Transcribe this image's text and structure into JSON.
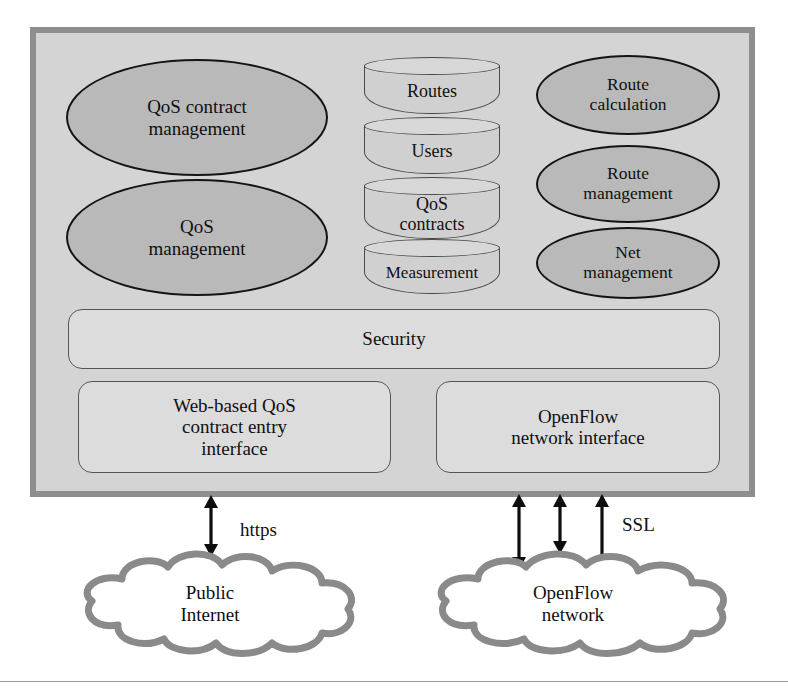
{
  "diagram": {
    "colors": {
      "frame_fill": "#d4d4d4",
      "frame_border": "#8e8e8e",
      "ellipse_fill": "#b9b9b9",
      "ellipse_border": "#141414",
      "cylinder_fill": "#d0d0d0",
      "cylinder_border": "#4a4a4a",
      "rrect_fill": "#dcdcdc",
      "rrect_border": "#555555",
      "cloud_fill": "#ffffff",
      "cloud_border": "#8a8a8a",
      "arrow_color": "#0d0d0d",
      "text_color": "#101010"
    }
  },
  "controller": {
    "modules_left": [
      {
        "id": "qos-contract-management",
        "label": "QoS contract\nmanagement"
      },
      {
        "id": "qos-management",
        "label": "QoS\nmanagement"
      }
    ],
    "datastores": [
      {
        "id": "routes",
        "label": "Routes"
      },
      {
        "id": "users",
        "label": "Users"
      },
      {
        "id": "qos-contracts",
        "label": "QoS\ncontracts"
      },
      {
        "id": "measurement",
        "label": "Measurement"
      }
    ],
    "modules_right": [
      {
        "id": "route-calculation",
        "label": "Route\ncalculation"
      },
      {
        "id": "route-management",
        "label": "Route\nmanagement"
      },
      {
        "id": "net-management",
        "label": "Net\nmanagement"
      }
    ],
    "security_layer": {
      "id": "security",
      "label": "Security"
    },
    "interfaces": [
      {
        "id": "web-qos-contract-entry-interface",
        "label": "Web-based QoS\ncontract entry\ninterface"
      },
      {
        "id": "openflow-network-interface",
        "label": "OpenFlow\nnetwork interface"
      }
    ]
  },
  "external": {
    "clouds": [
      {
        "id": "public-internet",
        "label": "Public\nInternet"
      },
      {
        "id": "openflow-network",
        "label": "OpenFlow\nnetwork"
      }
    ],
    "connections": [
      {
        "id": "https-link",
        "label": "https",
        "arrows": 1,
        "bidirectional": true
      },
      {
        "id": "ssl-link",
        "label": "SSL",
        "arrows": 3,
        "bidirectional": true
      }
    ]
  }
}
